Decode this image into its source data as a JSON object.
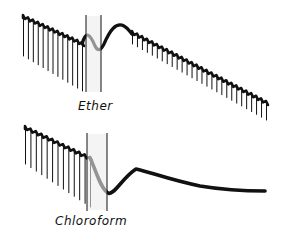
{
  "figure": {
    "panels": [
      {
        "label": "Ether",
        "description": "Kymograph tracing showing rhythmic contractions, interruption between two vertical markers, then recovery of contractions"
      },
      {
        "label": "Chloroform",
        "description": "Kymograph tracing showing rhythmic contractions, interruption between two vertical markers, then arrest with smooth decaying baseline"
      }
    ],
    "colors": {
      "trace": "#111111",
      "background": "#ffffff",
      "marker_shade": "#e6e6e6"
    }
  }
}
